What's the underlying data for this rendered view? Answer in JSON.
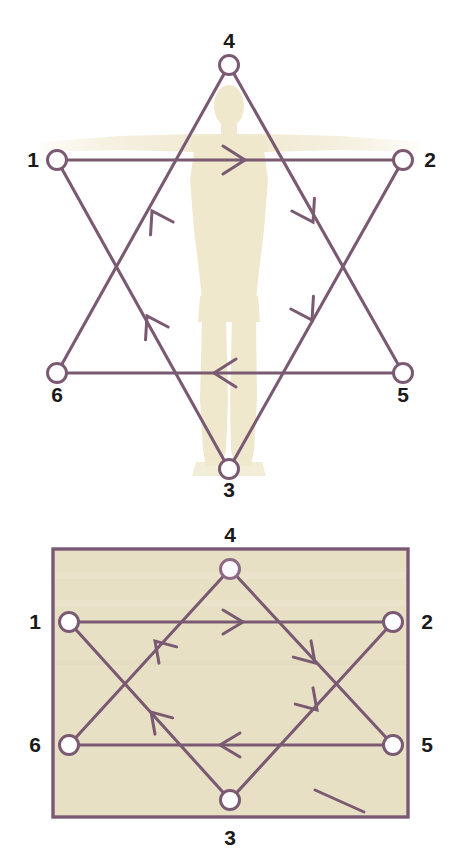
{
  "figure": {
    "title_visible": false,
    "colors": {
      "stroke": "#7a5a72",
      "stroke_light": "#8d6a84",
      "node_fill": "#ffffff",
      "body_silhouette": "#f2ecd6",
      "rect_fill": "#e8e0c4",
      "rect_border": "#7a5a72",
      "label_text": "#1a1a1a",
      "page_background": "#ffffff"
    }
  },
  "panels": [
    {
      "id": "hexagram-over-body",
      "name": "Hexagram traced over standing human figure",
      "background_image": "human-body-silhouette",
      "nodes": [
        {
          "id": "n1",
          "label": "1",
          "cx": 57,
          "cy": 160,
          "r": 9,
          "label_x": 33,
          "label_y": 167,
          "label_anchor": "middle"
        },
        {
          "id": "n2",
          "label": "2",
          "cx": 403,
          "cy": 160,
          "r": 9,
          "label_x": 430,
          "label_y": 167,
          "label_anchor": "middle"
        },
        {
          "id": "n3",
          "label": "3",
          "cx": 229,
          "cy": 469,
          "r": 9,
          "label_x": 229,
          "label_y": 497,
          "label_anchor": "middle"
        },
        {
          "id": "n4",
          "label": "4",
          "cx": 229,
          "cy": 65,
          "r": 9,
          "label_x": 229,
          "label_y": 48,
          "label_anchor": "middle"
        },
        {
          "id": "n5",
          "label": "5",
          "cx": 403,
          "cy": 373,
          "r": 9,
          "label_x": 403,
          "label_y": 402,
          "label_anchor": "middle"
        },
        {
          "id": "n6",
          "label": "6",
          "cx": 57,
          "cy": 373,
          "r": 9,
          "label_x": 57,
          "label_y": 402,
          "label_anchor": "middle"
        }
      ],
      "edges": [
        {
          "id": "e12",
          "from": "n1",
          "to": "n2",
          "x1": 66,
          "y1": 160,
          "x2": 394,
          "y2": 160,
          "arrow_t": 0.52,
          "direction": "1 to 2"
        },
        {
          "id": "e23",
          "from": "n2",
          "to": "n3",
          "x1": 398,
          "y1": 169,
          "x2": 234,
          "y2": 461,
          "arrow_t": 0.44,
          "direction": "2 to 3"
        },
        {
          "id": "e34",
          "from": "n3",
          "to": "n4",
          "x1": 224,
          "y1": 461,
          "x2": 224,
          "y2": 74,
          "arrow_t": 0.0,
          "direction": "3 to 4"
        },
        {
          "id": "e45",
          "from": "n4",
          "to": "n5",
          "x1": 234,
          "y1": 74,
          "x2": 398,
          "y2": 365,
          "arrow_t": 0.4,
          "direction": "4 to 5"
        },
        {
          "id": "e56",
          "from": "n5",
          "to": "n6",
          "x1": 394,
          "y1": 373,
          "x2": 66,
          "y2": 373,
          "arrow_t": 0.52,
          "direction": "5 to 6"
        },
        {
          "id": "e61",
          "from": "n6",
          "to": "n1",
          "x1": 62,
          "y1": 365,
          "x2": 225,
          "y2": 74,
          "arrow_t": 0.0,
          "direction": "6 to 1"
        }
      ],
      "arrows": [
        {
          "id": "a-top",
          "on": "1 to 2",
          "x": 237,
          "y": 160,
          "angle": 0,
          "note": "rightward along top horizontal"
        },
        {
          "id": "a-right-up",
          "on": "2 to 3",
          "x": 310,
          "y": 218,
          "angle": 119,
          "note": "down-left on upper right diagonal"
        },
        {
          "id": "a-right-low",
          "on": "2 to 3",
          "x": 308,
          "y": 313,
          "angle": 119,
          "note": "down-left on lower right diagonal"
        },
        {
          "id": "a-bottom",
          "on": "5 to 6",
          "x": 222,
          "y": 373,
          "angle": 180,
          "note": "leftward along bottom horizontal"
        },
        {
          "id": "a-left-up",
          "on": "3 to 4",
          "x": 152,
          "y": 215,
          "angle": -61,
          "note": "up-right on upper left diagonal"
        },
        {
          "id": "a-left-low",
          "on": "3 to 4",
          "x": 148,
          "y": 320,
          "angle": -61,
          "note": "up-right on lower left diagonal"
        }
      ],
      "long_lines": [
        {
          "id": "L-1-to-5",
          "x1": 57,
          "y1": 160,
          "x2": 403,
          "y2": 373
        },
        {
          "id": "L-2-to-6",
          "x1": 403,
          "y1": 160,
          "x2": 57,
          "y2": 373
        },
        {
          "id": "L-4-to-3-left",
          "x1": 229,
          "y1": 65,
          "x2": 57,
          "y2": 373
        },
        {
          "id": "L-4-to-3-right",
          "x1": 229,
          "y1": 65,
          "x2": 403,
          "y2": 373
        },
        {
          "id": "L-3-up-left",
          "x1": 229,
          "y1": 469,
          "x2": 57,
          "y2": 160
        },
        {
          "id": "L-3-up-right",
          "x1": 229,
          "y1": 469,
          "x2": 403,
          "y2": 160
        }
      ]
    },
    {
      "id": "hexagram-in-rectangle",
      "name": "Same circuit drawn inside a plain rectangle",
      "rect": {
        "x": 53,
        "y": 549,
        "width": 355,
        "height": 268
      },
      "nodes": [
        {
          "id": "m1",
          "label": "1",
          "cx": 69,
          "cy": 622,
          "r": 9,
          "label_x": 35,
          "label_y": 629,
          "label_anchor": "middle"
        },
        {
          "id": "m2",
          "label": "2",
          "cx": 393,
          "cy": 622,
          "r": 9,
          "label_x": 427,
          "label_y": 629,
          "label_anchor": "middle"
        },
        {
          "id": "m3",
          "label": "3",
          "cx": 230,
          "cy": 800,
          "r": 9,
          "label_x": 230,
          "label_y": 842,
          "label_anchor": "middle"
        },
        {
          "id": "m4",
          "label": "4",
          "cx": 230,
          "cy": 569,
          "r": 9,
          "label_x": 230,
          "label_y": 542,
          "label_anchor": "middle"
        },
        {
          "id": "m5",
          "label": "5",
          "cx": 393,
          "cy": 745,
          "r": 9,
          "label_x": 427,
          "label_y": 752,
          "label_anchor": "middle"
        },
        {
          "id": "m6",
          "label": "6",
          "cx": 69,
          "cy": 745,
          "r": 9,
          "label_x": 35,
          "label_y": 752,
          "label_anchor": "middle"
        }
      ],
      "edges": [
        {
          "id": "f12",
          "from": "m1",
          "to": "m2",
          "x1": 78,
          "y1": 622,
          "x2": 384,
          "y2": 622,
          "direction": "1 to 2"
        },
        {
          "id": "f23",
          "from": "m2",
          "to": "m3",
          "x1": 387,
          "y1": 629,
          "x2": 236,
          "y2": 793,
          "direction": "2 to 3"
        },
        {
          "id": "f34",
          "from": "m3",
          "to": "m4",
          "x1": 224,
          "y1": 793,
          "x2": 224,
          "y2": 577,
          "direction": "3 to 4"
        },
        {
          "id": "f45",
          "from": "m4",
          "to": "m5",
          "x1": 236,
          "y1": 577,
          "x2": 387,
          "y2": 738,
          "direction": "4 to 5"
        },
        {
          "id": "f56",
          "from": "m5",
          "to": "m6",
          "x1": 384,
          "y1": 745,
          "x2": 78,
          "y2": 745,
          "direction": "5 to 6"
        },
        {
          "id": "f61",
          "from": "m6",
          "to": "m1",
          "x1": 74,
          "y1": 738,
          "x2": 226,
          "y2": 577,
          "direction": "6 to 1"
        }
      ],
      "arrows": [
        {
          "id": "b-top",
          "on": "1 to 2",
          "x": 235,
          "y": 622,
          "angle": 0,
          "note": "rightward along upper horizontal"
        },
        {
          "id": "b-right-up",
          "on": "2 to 3",
          "x": 310,
          "y": 660,
          "angle": 131,
          "note": "down-left upper right diagonal"
        },
        {
          "id": "b-right-low",
          "on": "2 to 3",
          "x": 313,
          "y": 707,
          "angle": 131,
          "note": "down-left lower right diagonal"
        },
        {
          "id": "b-bottom",
          "on": "5 to 6",
          "x": 228,
          "y": 745,
          "angle": 180,
          "note": "leftward along lower horizontal"
        },
        {
          "id": "b-left-up",
          "on": "3 to 4",
          "x": 155,
          "y": 645,
          "angle": -47,
          "note": "up-right upper left diagonal"
        },
        {
          "id": "b-left-low",
          "on": "3 to 4",
          "x": 150,
          "y": 710,
          "angle": -47,
          "note": "up-right lower left diagonal"
        }
      ],
      "long_lines": [
        {
          "id": "M-1-to-5",
          "x1": 69,
          "y1": 622,
          "x2": 393,
          "y2": 745
        },
        {
          "id": "M-2-to-6",
          "x1": 393,
          "y1": 622,
          "x2": 69,
          "y2": 745
        },
        {
          "id": "M-4-left",
          "x1": 230,
          "y1": 569,
          "x2": 69,
          "y2": 745
        },
        {
          "id": "M-4-right",
          "x1": 230,
          "y1": 569,
          "x2": 393,
          "y2": 745
        },
        {
          "id": "M-3-left",
          "x1": 230,
          "y1": 800,
          "x2": 69,
          "y2": 622
        },
        {
          "id": "M-3-right",
          "x1": 230,
          "y1": 800,
          "x2": 393,
          "y2": 622
        }
      ],
      "stray_mark": {
        "id": "pointer-tick",
        "x1": 315,
        "y1": 789,
        "x2": 364,
        "y2": 812
      }
    }
  ]
}
